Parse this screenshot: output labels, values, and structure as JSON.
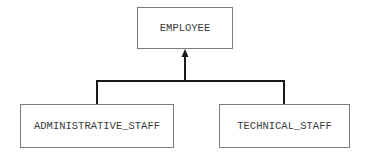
{
  "diagram": {
    "type": "class-hierarchy",
    "relationship": "inheritance",
    "parent": {
      "id": "employee",
      "label": "EMPLOYEE"
    },
    "children": [
      {
        "id": "administrative_staff",
        "label": "ADMINISTRATIVE_STAFF"
      },
      {
        "id": "technical_staff",
        "label": "TECHNICAL_STAFF"
      }
    ],
    "edges": [
      {
        "from": "administrative_staff",
        "to": "employee",
        "arrow": "filled-arrow-at-parent"
      },
      {
        "from": "technical_staff",
        "to": "employee",
        "arrow": "filled-arrow-at-parent"
      }
    ],
    "colors": {
      "box_border": "#7a7a7a",
      "connector": "#1a1a1a",
      "text": "#3a3a3a",
      "background": "#ffffff"
    }
  }
}
